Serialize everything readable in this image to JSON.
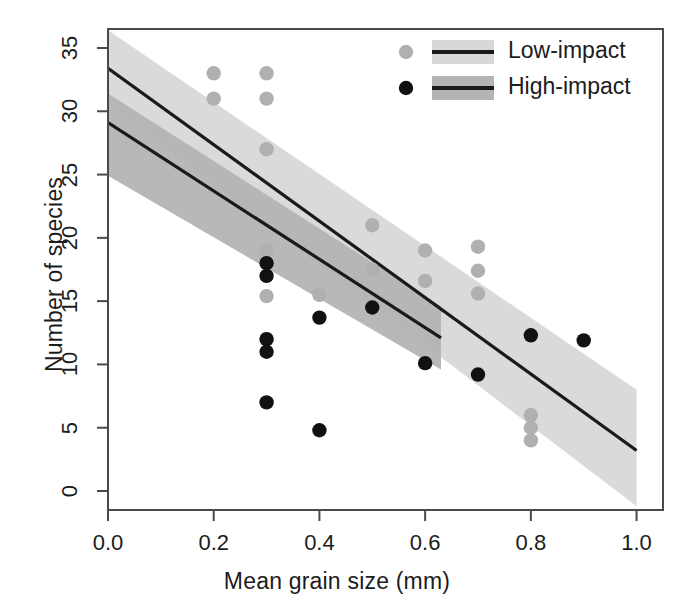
{
  "chart_data": {
    "type": "scatter",
    "title": "",
    "xlabel": "Mean grain size (mm)",
    "ylabel": "Number of species",
    "xlim": [
      0.0,
      1.05
    ],
    "ylim": [
      -1.5,
      36.5
    ],
    "xticks": [
      "0.0",
      "0.2",
      "0.4",
      "0.6",
      "0.8",
      "1.0"
    ],
    "xtick_values": [
      0.0,
      0.2,
      0.4,
      0.6,
      0.8,
      1.0
    ],
    "yticks": [
      "0",
      "5",
      "10",
      "15",
      "20",
      "25",
      "30",
      "35"
    ],
    "ytick_values": [
      0,
      5,
      10,
      15,
      20,
      25,
      30,
      35
    ],
    "grid": false,
    "legend_position": "top-right",
    "colors": {
      "low_impact_point": "#b0b0b0",
      "low_impact_band": "#d8d8d8",
      "high_impact_point": "#111111",
      "high_impact_band": "#b4b4b4",
      "fit_line": "#1a1a1a",
      "axis": "#4a4a4a"
    },
    "series": [
      {
        "name": "Low-impact",
        "marker": "filled-circle",
        "color": "#b0b0b0",
        "points": [
          {
            "x": 0.2,
            "y": 33
          },
          {
            "x": 0.2,
            "y": 31
          },
          {
            "x": 0.3,
            "y": 33
          },
          {
            "x": 0.3,
            "y": 31
          },
          {
            "x": 0.3,
            "y": 27
          },
          {
            "x": 0.3,
            "y": 19
          },
          {
            "x": 0.3,
            "y": 15.4
          },
          {
            "x": 0.3,
            "y": 12
          },
          {
            "x": 0.4,
            "y": 15.5
          },
          {
            "x": 0.5,
            "y": 21
          },
          {
            "x": 0.5,
            "y": 17.5
          },
          {
            "x": 0.6,
            "y": 19
          },
          {
            "x": 0.6,
            "y": 16.6
          },
          {
            "x": 0.7,
            "y": 19.3
          },
          {
            "x": 0.7,
            "y": 17.4
          },
          {
            "x": 0.7,
            "y": 15.6
          },
          {
            "x": 0.8,
            "y": 6.0
          },
          {
            "x": 0.8,
            "y": 5.0
          },
          {
            "x": 0.8,
            "y": 4.0
          }
        ]
      },
      {
        "name": "High-impact",
        "marker": "filled-circle",
        "color": "#111111",
        "points": [
          {
            "x": 0.3,
            "y": 18
          },
          {
            "x": 0.3,
            "y": 17
          },
          {
            "x": 0.3,
            "y": 12
          },
          {
            "x": 0.3,
            "y": 11
          },
          {
            "x": 0.3,
            "y": 7
          },
          {
            "x": 0.4,
            "y": 13.7
          },
          {
            "x": 0.4,
            "y": 4.8
          },
          {
            "x": 0.5,
            "y": 14.5
          },
          {
            "x": 0.6,
            "y": 10.1
          },
          {
            "x": 0.7,
            "y": 9.2
          },
          {
            "x": 0.8,
            "y": 12.3
          },
          {
            "x": 0.9,
            "y": 11.9
          }
        ]
      }
    ],
    "fits": [
      {
        "name": "Low-impact",
        "x_start": 0.0,
        "x_end": 1.0,
        "y_start": 33.4,
        "y_end": 3.2,
        "band_color": "#d8d8d8",
        "line_color": "#1a1a1a",
        "ci_upper_start": 36.4,
        "ci_upper_end": 8.0,
        "ci_lower_start": 30.6,
        "ci_lower_end": -1.2
      },
      {
        "name": "High-impact",
        "x_start": 0.0,
        "x_end": 0.63,
        "y_start": 29.1,
        "y_end": 12.1,
        "band_color": "#b4b4b4",
        "line_color": "#1a1a1a",
        "ci_upper_start": 31.4,
        "ci_upper_end": 14.6,
        "ci_lower_start": 24.9,
        "ci_lower_end": 9.6
      }
    ]
  },
  "legend": {
    "entries": [
      {
        "label": "Low-impact",
        "point_color": "#b0b0b0",
        "band_color": "#d8d8d8"
      },
      {
        "label": "High-impact",
        "point_color": "#111111",
        "band_color": "#b4b4b4"
      }
    ]
  }
}
